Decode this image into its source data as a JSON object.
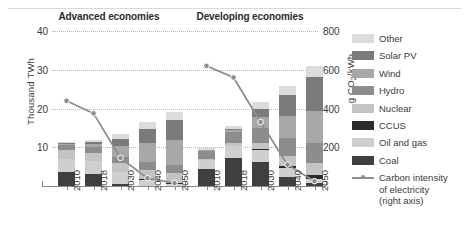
{
  "panels": [
    {
      "key": "advanced",
      "title": "Advanced economies"
    },
    {
      "key": "developing",
      "title": "Developing economies"
    }
  ],
  "axes": {
    "left_title": "Thousand TWh",
    "right_title_main": "g CO",
    "right_title_sub": "2",
    "right_title_tail": "/kWh",
    "left_ticks": [
      "10",
      "20",
      "30",
      "40"
    ],
    "right_ticks": [
      "200",
      "400",
      "600",
      "800"
    ]
  },
  "legend": {
    "items": [
      {
        "label": "Other",
        "color": "#dcdcdc"
      },
      {
        "label": "Solar PV",
        "color": "#7b7b7b"
      },
      {
        "label": "Wind",
        "color": "#a8a8a8"
      },
      {
        "label": "Hydro",
        "color": "#8d8d8d"
      },
      {
        "label": "Nuclear",
        "color": "#c4c4c4"
      },
      {
        "label": "CCUS",
        "color": "#2b2b2b"
      },
      {
        "label": "Oil and gas",
        "color": "#cfcfcf"
      },
      {
        "label": "Coal",
        "color": "#3f3f3f"
      }
    ],
    "line_label_line1": "Carbon intensity",
    "line_label_line2": "of electricity",
    "line_label_line3": "(right axis)",
    "line_color": "#8e8e8e"
  },
  "chart_data": {
    "type": "bar",
    "title": "",
    "subtitle": "",
    "xlabel": "",
    "ylabel": "Thousand TWh",
    "ylabel_secondary": "g CO2/kWh",
    "ylim": [
      0,
      40
    ],
    "ylim_secondary": [
      0,
      800
    ],
    "grid": true,
    "legend_position": "right",
    "categories": [
      "2010",
      "2018",
      "2030",
      "2040",
      "2050"
    ],
    "panels": [
      {
        "name": "Advanced economies",
        "categories": [
          "2010",
          "2018",
          "2030",
          "2040",
          "2050"
        ],
        "series": [
          {
            "name": "Coal",
            "values": [
              3.6,
              3.0,
              0.5,
              0.0,
              0.0
            ]
          },
          {
            "name": "Oil and gas",
            "values": [
              3.4,
              3.4,
              3.1,
              1.6,
              0.5
            ]
          },
          {
            "name": "CCUS",
            "values": [
              0.0,
              0.0,
              0.1,
              0.3,
              0.4
            ]
          },
          {
            "name": "Nuclear",
            "values": [
              2.2,
              2.1,
              2.2,
              2.3,
              2.4
            ]
          },
          {
            "name": "Hydro",
            "values": [
              1.4,
              1.5,
              1.7,
              1.9,
              2.0
            ]
          },
          {
            "name": "Wind",
            "values": [
              0.3,
              0.9,
              2.8,
              5.0,
              6.6
            ]
          },
          {
            "name": "Solar PV",
            "values": [
              0.1,
              0.4,
              1.8,
              3.6,
              5.1
            ]
          },
          {
            "name": "Other",
            "values": [
              0.4,
              0.7,
              1.3,
              1.8,
              2.2
            ]
          }
        ],
        "totals": [
          11.4,
          12.0,
          13.5,
          16.5,
          19.2
        ],
        "line": {
          "name": "Carbon intensity of electricity (right axis)",
          "axis": "secondary",
          "values": [
            440,
            375,
            145,
            40,
            15
          ]
        }
      },
      {
        "name": "Developing economies",
        "categories": [
          "2010",
          "2018",
          "2030",
          "2040",
          "2050"
        ],
        "series": [
          {
            "name": "Coal",
            "values": [
              4.3,
              7.3,
              6.2,
              2.4,
              0.7
            ]
          },
          {
            "name": "Oil and gas",
            "values": [
              2.4,
              3.1,
              3.1,
              2.2,
              1.1
            ]
          },
          {
            "name": "CCUS",
            "values": [
              0.0,
              0.0,
              0.2,
              0.6,
              1.0
            ]
          },
          {
            "name": "Nuclear",
            "values": [
              0.4,
              0.8,
              1.7,
              2.5,
              3.1
            ]
          },
          {
            "name": "Hydro",
            "values": [
              2.0,
              2.7,
              3.9,
              4.8,
              5.3
            ]
          },
          {
            "name": "Wind",
            "values": [
              0.2,
              0.6,
              2.6,
              5.6,
              8.2
            ]
          },
          {
            "name": "Solar PV",
            "values": [
              0.0,
              0.3,
              2.2,
              5.4,
              8.7
            ]
          },
          {
            "name": "Other",
            "values": [
              0.4,
              0.8,
              1.7,
              2.4,
              3.0
            ]
          }
        ],
        "totals": [
          9.7,
          15.6,
          21.6,
          25.9,
          31.1
        ],
        "line": {
          "name": "Carbon intensity of electricity (right axis)",
          "axis": "secondary",
          "values": [
            620,
            560,
            330,
            110,
            25
          ]
        }
      }
    ]
  }
}
